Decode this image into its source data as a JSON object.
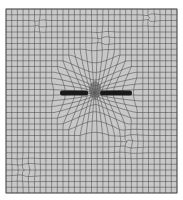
{
  "figure": {
    "background_color": "#ffffff",
    "mesh_fill_color": "#c8c8c8",
    "line_color": "#4a4a4a",
    "crack_color": "#1a1a1a"
  },
  "mesh": {
    "bounds": {
      "x0": 6,
      "y0": 9,
      "x1": 177,
      "y1": 193
    },
    "cols": 30,
    "rows": 32,
    "crack": {
      "x0": 60,
      "x1": 132,
      "y": 93,
      "gap_x0": 88,
      "gap_x1": 100
    },
    "refinement_center": {
      "x": 95,
      "y": 93
    },
    "irregular_patches": [
      {
        "cx": 103,
        "cy": 40,
        "r": 16
      },
      {
        "cx": 128,
        "cy": 142,
        "r": 22
      },
      {
        "cx": 25,
        "cy": 170,
        "r": 18
      },
      {
        "cx": 150,
        "cy": 18,
        "r": 12
      },
      {
        "cx": 40,
        "cy": 25,
        "r": 10
      }
    ]
  }
}
